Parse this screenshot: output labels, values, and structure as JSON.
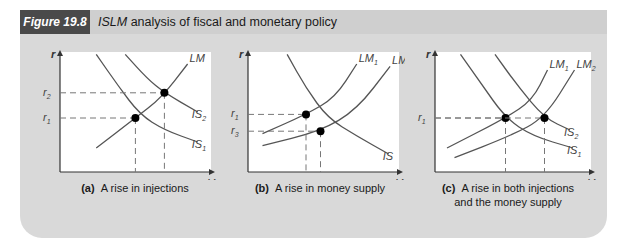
{
  "figure": {
    "label": "Figure 19.8",
    "title_italic": "ISLM",
    "title_rest": " analysis of fiscal and monetary policy"
  },
  "colors": {
    "frame_bg": "#d9d9d9",
    "label_bg": "#4a4a4a",
    "curve": "#555555",
    "dash": "#777777",
    "point": "#000000"
  },
  "chart_data": [
    {
      "type": "line",
      "panel": "a",
      "caption_tag": "(a)",
      "caption": "A rise in injections",
      "xlabel": "Y",
      "ylabel": "r",
      "origin_label": "O",
      "curves": [
        {
          "name": "LM",
          "kind": "upward",
          "points": [
            [
              0.25,
              0.2
            ],
            [
              0.52,
              0.45
            ],
            [
              0.7,
              0.62
            ],
            [
              0.88,
              0.9
            ]
          ]
        },
        {
          "name": "IS1",
          "label_main": "IS",
          "label_sub": "1",
          "kind": "downward",
          "points": [
            [
              0.25,
              0.98
            ],
            [
              0.4,
              0.72
            ],
            [
              0.55,
              0.48
            ],
            [
              0.72,
              0.35
            ],
            [
              0.95,
              0.25
            ]
          ]
        },
        {
          "name": "IS2",
          "label_main": "IS",
          "label_sub": "2",
          "kind": "downward",
          "points": [
            [
              0.45,
              0.98
            ],
            [
              0.6,
              0.78
            ],
            [
              0.72,
              0.66
            ],
            [
              0.95,
              0.5
            ]
          ]
        }
      ],
      "equilibria": [
        {
          "x": 0.52,
          "y": 0.45,
          "x_label": "Y",
          "x_sub": "1",
          "y_label": "r",
          "y_sub": "1"
        },
        {
          "x": 0.72,
          "y": 0.66,
          "x_label": "Y",
          "x_sub": "2",
          "y_label": "r",
          "y_sub": "2"
        }
      ],
      "top_labels": [
        {
          "main": "LM",
          "sub": ""
        }
      ]
    },
    {
      "type": "line",
      "panel": "b",
      "caption_tag": "(b)",
      "caption": "A rise in money supply",
      "xlabel": "Y",
      "ylabel": "r",
      "origin_label": "O",
      "curves": [
        {
          "name": "IS",
          "label_main": "IS",
          "label_sub": "",
          "kind": "downward",
          "points": [
            [
              0.27,
              0.98
            ],
            [
              0.4,
              0.7
            ],
            [
              0.55,
              0.45
            ],
            [
              0.75,
              0.3
            ],
            [
              0.97,
              0.15
            ]
          ]
        },
        {
          "name": "LM1",
          "kind": "upward",
          "points": [
            [
              0.1,
              0.32
            ],
            [
              0.4,
              0.48
            ],
            [
              0.6,
              0.62
            ],
            [
              0.75,
              0.9
            ]
          ]
        },
        {
          "name": "LM2",
          "kind": "upward",
          "points": [
            [
              0.1,
              0.22
            ],
            [
              0.5,
              0.34
            ],
            [
              0.75,
              0.52
            ],
            [
              0.98,
              0.88
            ]
          ]
        }
      ],
      "equilibria": [
        {
          "x": 0.4,
          "y": 0.48,
          "x_label": "Y",
          "x_sub": "1",
          "y_label": "r",
          "y_sub": "1"
        },
        {
          "x": 0.5,
          "y": 0.34,
          "x_label": "Y",
          "x_sub": "3",
          "y_label": "r",
          "y_sub": "3"
        }
      ],
      "top_labels": [
        {
          "main": "LM",
          "sub": "1"
        },
        {
          "main": "LM",
          "sub": "2"
        }
      ]
    },
    {
      "type": "line",
      "panel": "c",
      "caption_tag": "(c)",
      "caption": "A rise in both injections",
      "caption_line2": "and the money supply",
      "xlabel": "Y",
      "ylabel": "r",
      "origin_label": "O",
      "curves": [
        {
          "name": "IS1",
          "label_main": "IS",
          "label_sub": "1",
          "kind": "downward",
          "points": [
            [
              0.17,
              0.98
            ],
            [
              0.3,
              0.75
            ],
            [
              0.47,
              0.45
            ],
            [
              0.65,
              0.3
            ],
            [
              0.92,
              0.2
            ]
          ]
        },
        {
          "name": "IS2",
          "label_main": "IS",
          "label_sub": "2",
          "kind": "downward",
          "points": [
            [
              0.4,
              0.98
            ],
            [
              0.55,
              0.72
            ],
            [
              0.73,
              0.45
            ],
            [
              0.9,
              0.35
            ]
          ]
        },
        {
          "name": "LM1",
          "kind": "upward",
          "points": [
            [
              0.08,
              0.2
            ],
            [
              0.47,
              0.45
            ],
            [
              0.65,
              0.6
            ],
            [
              0.75,
              0.85
            ]
          ]
        },
        {
          "name": "LM2",
          "kind": "upward",
          "points": [
            [
              0.13,
              0.12
            ],
            [
              0.5,
              0.3
            ],
            [
              0.73,
              0.45
            ],
            [
              0.93,
              0.85
            ]
          ]
        }
      ],
      "equilibria": [
        {
          "x": 0.47,
          "y": 0.45,
          "x_label": "Y",
          "x_sub": "1",
          "y_label": "r",
          "y_sub": "1"
        },
        {
          "x": 0.73,
          "y": 0.45,
          "x_label": "Y",
          "x_sub": "4",
          "y_label": "",
          "y_sub": ""
        }
      ],
      "top_labels": [
        {
          "main": "LM",
          "sub": "1"
        },
        {
          "main": "LM",
          "sub": "2"
        }
      ]
    }
  ]
}
